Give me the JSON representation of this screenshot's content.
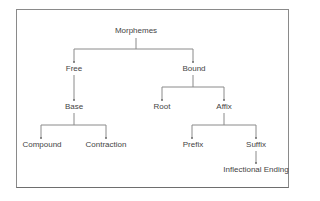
{
  "diagram": {
    "type": "tree",
    "title": "Morphemes",
    "colors": {
      "line": "#8a8a8a",
      "text": "#444444",
      "border": "#8a8a8a",
      "background": "#ffffff"
    },
    "nodes": {
      "morphemes": "Morphemes",
      "free": "Free",
      "bound": "Bound",
      "base": "Base",
      "root": "Root",
      "affix": "Affix",
      "compound": "Compound",
      "contraction": "Contraction",
      "prefix": "Prefix",
      "suffix": "Suffix",
      "inflectional_ending": "Inflectional Ending"
    },
    "edges": [
      [
        "Morphemes",
        "Free"
      ],
      [
        "Morphemes",
        "Bound"
      ],
      [
        "Free",
        "Base"
      ],
      [
        "Base",
        "Compound"
      ],
      [
        "Base",
        "Contraction"
      ],
      [
        "Bound",
        "Root"
      ],
      [
        "Bound",
        "Affix"
      ],
      [
        "Affix",
        "Prefix"
      ],
      [
        "Affix",
        "Suffix"
      ],
      [
        "Suffix",
        "Inflectional Ending"
      ]
    ]
  }
}
